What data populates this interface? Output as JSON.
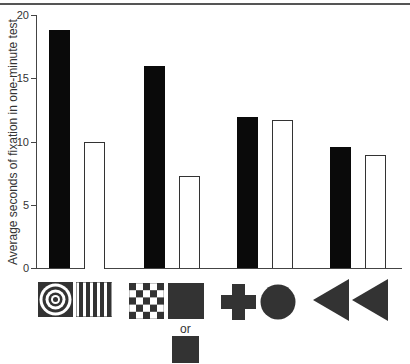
{
  "chart_data": {
    "type": "bar",
    "title": "",
    "xlabel": "",
    "ylabel": "Average seconds of fixation in one-minute test",
    "ylim": [
      0,
      20
    ],
    "yticks": [
      0,
      5,
      10,
      15,
      20
    ],
    "grid": false,
    "legend": null,
    "categories": [
      "Bullseye vs. vertical stripes",
      "Checkerboard vs. plain square (or smaller plain square)",
      "Cross vs. circle",
      "Two triangles"
    ],
    "series": [
      {
        "name": "Left stimulus (black bars)",
        "color": "#0a0a0a",
        "values": [
          18.8,
          16.0,
          11.9,
          9.6
        ]
      },
      {
        "name": "Right stimulus (white bars)",
        "color": "#ffffff",
        "values": [
          10.0,
          7.3,
          11.7,
          8.9
        ]
      }
    ],
    "stimulus_pairs": [
      {
        "left": "bullseye",
        "right": "vertical-stripes"
      },
      {
        "left": "checkerboard",
        "right": "plain-dark-square",
        "alternate": "small-plain-dark-square",
        "alternate_label": "or"
      },
      {
        "left": "cross",
        "right": "circle"
      },
      {
        "left": "left-pointing-triangle",
        "right": "left-pointing-triangle"
      }
    ]
  },
  "axis": {
    "ylabel": "Average seconds of fixation in one-minute test",
    "tick_labels": [
      "0",
      "5",
      "10",
      "15",
      "20"
    ]
  },
  "annotations": {
    "or_label": "or"
  }
}
